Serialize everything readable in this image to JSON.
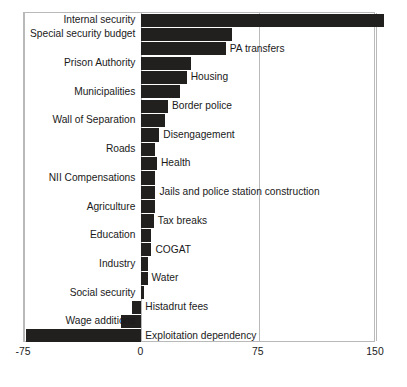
{
  "chart_data": {
    "type": "bar",
    "orientation": "horizontal",
    "title": "",
    "subtitle": "",
    "xlabel": "",
    "ylabel": "",
    "xlim": [
      -75,
      150
    ],
    "xticks": [
      -75,
      0,
      75,
      150
    ],
    "xtick_labels": [
      "-75",
      "0",
      "75",
      "150"
    ],
    "grid": "vertical-only",
    "legend": "none",
    "bar_color": "#221f1f",
    "axis_color": "#b9b9b9",
    "label_placement": "alternating: odd rows labelled to the left of the axis, even rows labelled to the right of the bar",
    "categories": [
      "Internal security",
      "Special security budget",
      "PA transfers",
      "Prison Authority",
      "Housing",
      "Municipalities",
      "Border police",
      "Wall of Separation",
      "Disengagement",
      "Roads",
      "Health",
      "NII Compensations",
      "Jails and police station construction",
      "Agriculture",
      "Tax breaks",
      "Education",
      "COGAT",
      "Industry",
      "Water",
      "Social security",
      "Histadrut fees",
      "Wage additions",
      "Exploitation dependency"
    ],
    "values": [
      155,
      58,
      54,
      32,
      29,
      25,
      17,
      15,
      11.5,
      9,
      10,
      9,
      9,
      9,
      8,
      6.5,
      6.5,
      4,
      4,
      2,
      -6,
      -13,
      -74
    ],
    "label_side": [
      "left",
      "left",
      "right",
      "left",
      "right",
      "left",
      "right",
      "left",
      "right",
      "left",
      "right",
      "left",
      "right",
      "left",
      "right",
      "left",
      "right",
      "left",
      "right",
      "left",
      "right",
      "left",
      "right"
    ]
  },
  "axis": {
    "ticks": [
      {
        "label": "-75",
        "value": -75
      },
      {
        "label": "0",
        "value": 0
      },
      {
        "label": "75",
        "value": 75
      },
      {
        "label": "150",
        "value": 150
      }
    ]
  }
}
